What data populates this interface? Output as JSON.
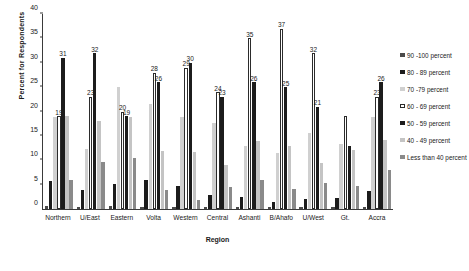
{
  "chart_data": {
    "type": "bar",
    "title": "",
    "xlabel": "Region",
    "ylabel": "Percent for Respondents",
    "ylim": [
      0,
      40
    ],
    "yticks": [
      0,
      5,
      10,
      15,
      20,
      25,
      30,
      35,
      40
    ],
    "grid": false,
    "legend_position": "right",
    "categories": [
      "Northern",
      "U/East",
      "Eastern",
      "Volta",
      "Western",
      "Central",
      "Ashanti",
      "B/Ahafo",
      "U/West",
      "Gt.",
      "Accra"
    ],
    "series": [
      {
        "name": "90 -100 percent",
        "color": "#4a4a4a",
        "values": [
          0.6,
          0.5,
          0.6,
          0.5,
          0.5,
          0.5,
          0.5,
          0.4,
          0.5,
          0.5,
          0.5
        ]
      },
      {
        "name": "80 - 89 percent",
        "color": "#1c1c1c",
        "values": [
          5.7,
          3.8,
          5.1,
          5.9,
          4.8,
          2.9,
          2.4,
          1.4,
          2.0,
          2.3,
          3.6
        ]
      },
      {
        "name": "70 -79 percent",
        "color": "#d0d0d0",
        "values": [
          18.9,
          12.3,
          25.0,
          21.6,
          18.8,
          17.7,
          13.0,
          11.4,
          15.6,
          13.4,
          18.8
        ]
      },
      {
        "name": "60 - 69 percent",
        "color": "#ffffff",
        "values": [
          19.0,
          23.0,
          20.0,
          28.0,
          29.0,
          24.0,
          35.0,
          37.0,
          32.0,
          19.0,
          23.0
        ],
        "labels": [
          "19",
          "23",
          "20",
          "28",
          "29",
          "24",
          "35",
          "37",
          "32",
          "",
          "23"
        ]
      },
      {
        "name": "50 - 59 percent",
        "color": "#1c1c1c",
        "values": [
          31.0,
          32.0,
          19.0,
          26.0,
          30.0,
          23.0,
          26.0,
          25.0,
          21.0,
          13.0,
          26.0
        ],
        "labels": [
          "31",
          "32",
          "19",
          "26",
          "30",
          "23",
          "26",
          "25",
          "21",
          "",
          "26"
        ]
      },
      {
        "name": "40 - 49 percent",
        "color": "#c4c4c4",
        "values": [
          19.0,
          18.1,
          18.9,
          12.0,
          11.7,
          9.0,
          14.0,
          13.0,
          9.5,
          12.1,
          14.2
        ]
      },
      {
        "name": "Less than 40 percent",
        "color": "#8a8a8a",
        "values": [
          5.9,
          9.6,
          10.5,
          4.0,
          1.9,
          4.6,
          6.0,
          4.2,
          5.4,
          4.8,
          8.0
        ]
      }
    ]
  }
}
